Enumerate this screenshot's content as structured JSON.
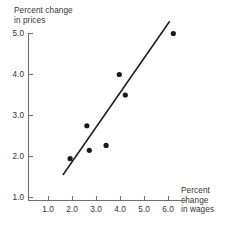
{
  "chart_data": {
    "type": "scatter",
    "title": "",
    "xlabel": "Percent change in wages",
    "ylabel": "Percent change in prices",
    "xlabel_lines": [
      "Percent",
      "change",
      "in wages"
    ],
    "ylabel_lines": [
      "Percent change",
      "in prices"
    ],
    "xticks": [
      "1.0",
      "2.0",
      "3.0",
      "4.0",
      "5.0",
      "6.0"
    ],
    "yticks": [
      "5.0",
      "4.0",
      "3.0",
      "2.0",
      "1.0"
    ],
    "xtick_values": [
      1.0,
      2.0,
      3.0,
      4.0,
      5.0,
      6.0
    ],
    "ytick_values": [
      5.0,
      4.0,
      3.0,
      2.0,
      1.0
    ],
    "xlim": [
      0.25,
      6.9
    ],
    "ylim": [
      0.55,
      5.45
    ],
    "grid": false,
    "legend": "none",
    "points": [
      {
        "x": 1.9,
        "y": 1.95
      },
      {
        "x": 2.6,
        "y": 2.75
      },
      {
        "x": 2.7,
        "y": 2.15
      },
      {
        "x": 3.4,
        "y": 2.27
      },
      {
        "x": 3.95,
        "y": 4.0
      },
      {
        "x": 4.2,
        "y": 3.5
      },
      {
        "x": 6.2,
        "y": 5.0
      }
    ],
    "trendline": {
      "name": "fitted line",
      "x0": 1.6,
      "y0": 1.55,
      "x1": 6.05,
      "y1": 5.3
    },
    "marker_color": "#1a1a1a",
    "line_color": "#1a1a1a",
    "axis_color": "#707070"
  }
}
